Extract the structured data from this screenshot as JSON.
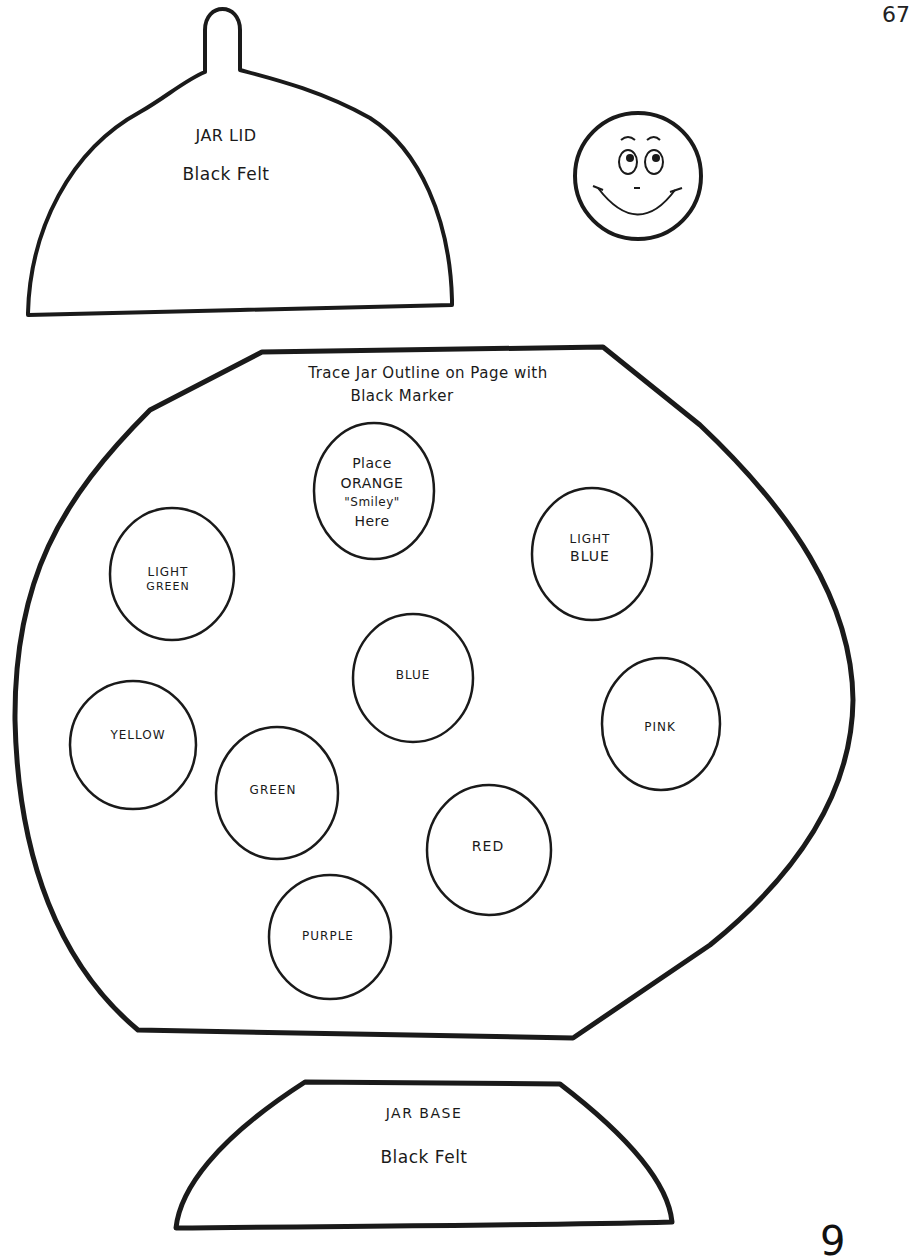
{
  "page_number": "67",
  "corner_mark": "9",
  "jar_lid": {
    "title": "JAR LID",
    "material": "Black Felt"
  },
  "smiley": {
    "icon": "smiley-face-icon"
  },
  "jar_body": {
    "instruction_line1": "Trace Jar Outline on Page with",
    "instruction_line2": "Black Marker",
    "circles": [
      {
        "lines": [
          "Place",
          "ORANGE",
          "\"Smiley\"",
          "Here"
        ]
      },
      {
        "lines": [
          "LIGHT",
          "GREEN"
        ]
      },
      {
        "lines": [
          "LIGHT",
          "BLUE"
        ]
      },
      {
        "lines": [
          "BLUE"
        ]
      },
      {
        "lines": [
          "YELLOW"
        ]
      },
      {
        "lines": [
          "PINK"
        ]
      },
      {
        "lines": [
          "GREEN"
        ]
      },
      {
        "lines": [
          "RED"
        ]
      },
      {
        "lines": [
          "PURPLE"
        ]
      }
    ]
  },
  "jar_base": {
    "title": "JAR BASE",
    "material": "Black Felt"
  },
  "colors": {
    "ink": "#1a1a1a",
    "paper": "#ffffff"
  }
}
